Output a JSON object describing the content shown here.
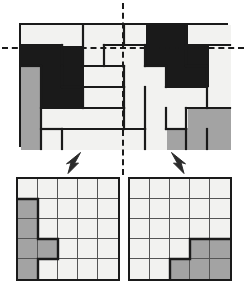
{
  "figure": {
    "type": "diagram"
  },
  "colors": {
    "white": "#f2f2f0",
    "gray": "#a3a3a3",
    "black": "#1a1a1a",
    "outline": "#1a1a1a",
    "grid_line": "#555555",
    "background": "#ffffff"
  },
  "board": {
    "name": "main-board",
    "columns": 10,
    "rows": 6,
    "cell_fills": [
      [
        "white",
        "white",
        "white",
        "white",
        "white",
        "white",
        "black",
        "black",
        "white",
        "white"
      ],
      [
        "black",
        "black",
        "black",
        "white",
        "white",
        "white",
        "black",
        "black",
        "black",
        "white"
      ],
      [
        "gray",
        "black",
        "black",
        "white",
        "white",
        "white",
        "white",
        "black",
        "black",
        "white"
      ],
      [
        "gray",
        "black",
        "black",
        "white",
        "white",
        "white",
        "white",
        "white",
        "white",
        "white"
      ],
      [
        "gray",
        "white",
        "white",
        "white",
        "white",
        "white",
        "white",
        "white",
        "gray",
        "gray"
      ],
      [
        "gray",
        "white",
        "white",
        "white",
        "white",
        "white",
        "white",
        "gray",
        "gray",
        "gray"
      ]
    ],
    "fill_counts": {
      "white": 41,
      "gray": 10,
      "black": 9
    }
  },
  "axes": {
    "horizontal": {
      "name": "horizontal-symmetry-axis",
      "style": "dashed",
      "position_row": 1
    },
    "vertical": {
      "name": "vertical-symmetry-axis",
      "style": "dashed",
      "position_column": 5
    }
  },
  "arrows": [
    {
      "name": "arrow-to-left-grid",
      "direction": "down-left"
    },
    {
      "name": "arrow-to-right-grid",
      "direction": "down-right"
    }
  ],
  "mini_grids": [
    {
      "name": "left-half-grid",
      "columns": 5,
      "rows": 5,
      "cell_fills": [
        [
          "white",
          "white",
          "white",
          "white",
          "white"
        ],
        [
          "gray",
          "white",
          "white",
          "white",
          "white"
        ],
        [
          "gray",
          "white",
          "white",
          "white",
          "white"
        ],
        [
          "gray",
          "gray",
          "white",
          "white",
          "white"
        ],
        [
          "gray",
          "white",
          "white",
          "white",
          "white"
        ]
      ],
      "gray_count": 6
    },
    {
      "name": "right-half-grid",
      "columns": 5,
      "rows": 5,
      "cell_fills": [
        [
          "white",
          "white",
          "white",
          "white",
          "white"
        ],
        [
          "white",
          "white",
          "white",
          "white",
          "white"
        ],
        [
          "white",
          "white",
          "white",
          "white",
          "white"
        ],
        [
          "white",
          "white",
          "white",
          "gray",
          "gray"
        ],
        [
          "white",
          "white",
          "gray",
          "gray",
          "gray"
        ]
      ],
      "gray_count": 5
    }
  ]
}
